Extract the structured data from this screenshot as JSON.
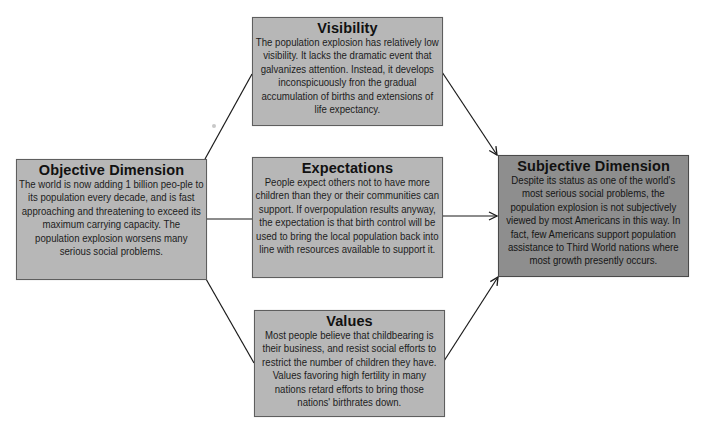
{
  "diagram": {
    "type": "flow",
    "colors": {
      "box_fill": "#b7b7b7",
      "box_fill_emphasis": "#8e8e8e",
      "box_border": "#5e5e5e",
      "connector": "#1a1a1a",
      "background": "#ffffff"
    },
    "nodes": {
      "objective": {
        "title": "Objective Dimension",
        "body": "The world is now adding 1 billion peo-ple to its population every decade, and is fast approaching and threatening to exceed its maximum carrying capacity. The population explosion worsens many serious social problems."
      },
      "visibility": {
        "title": "Visibility",
        "body": "The population explosion has relatively low visibility. It lacks the dramatic event that galvanizes attention. Instead, it develops inconspicuously fron the gradual accumulation of births and extensions of life expectancy."
      },
      "expectations": {
        "title": "Expectations",
        "body": "People expect others not to have more children than they or their communities can support. If overpopulation results anyway, the expectation is that birth control will be used to bring the local population back into line with resources available to support it."
      },
      "values": {
        "title": "Values",
        "body": "Most people believe that childbearing is their business, and resist social efforts to restrict the number of children they have. Values favoring high fertility in many nations retard efforts to bring those nations' birthrates down."
      },
      "subjective": {
        "title": "Subjective Dimension",
        "body": "Despite its status as one of the world's most serious social problems, the population explosion is not subjectively viewed by most Americans in this way. In fact, few Americans support population assistance to Third World nations where most growth presently occurs."
      }
    },
    "edges": [
      {
        "from": "objective",
        "to": "visibility",
        "arrow": false
      },
      {
        "from": "objective",
        "to": "expectations",
        "arrow": false
      },
      {
        "from": "objective",
        "to": "values",
        "arrow": false
      },
      {
        "from": "visibility",
        "to": "subjective",
        "arrow": true
      },
      {
        "from": "expectations",
        "to": "subjective",
        "arrow": true
      },
      {
        "from": "values",
        "to": "subjective",
        "arrow": true
      }
    ]
  }
}
